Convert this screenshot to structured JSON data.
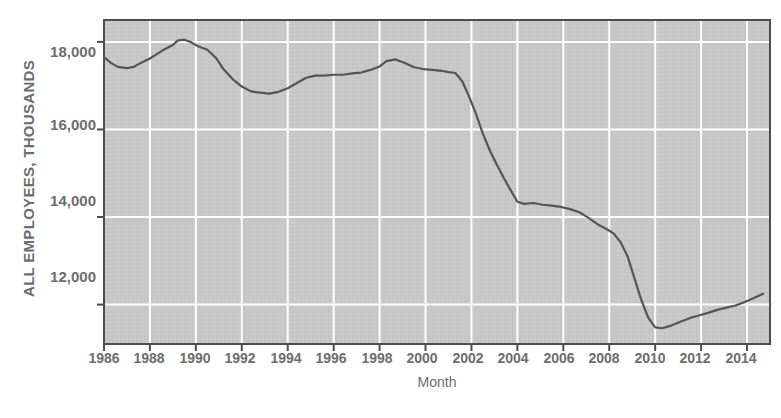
{
  "chart_data": {
    "type": "line",
    "title": "",
    "xlabel": "Month",
    "ylabel": "ALL EMPLOYEES, THOUSANDS",
    "xlim": [
      1986,
      2015
    ],
    "ylim": [
      11100,
      18500
    ],
    "grid": true,
    "legend": "none",
    "line_color": "#555555",
    "plot_background": "#c6c6c6",
    "gridline_color": "#ffffff",
    "axis_color": "#4d4d4d",
    "y_ticks": [
      12000,
      14000,
      16000,
      18000
    ],
    "y_tick_labels": [
      "12,000",
      "14,000",
      "16,000",
      "18,000"
    ],
    "x_ticks": [
      1986,
      1988,
      1990,
      1992,
      1994,
      1996,
      1998,
      2000,
      2002,
      2004,
      2006,
      2008,
      2010,
      2012,
      2014
    ],
    "x_tick_labels": [
      "1986",
      "1988",
      "1990",
      "1992",
      "1994",
      "1996",
      "1998",
      "2000",
      "2002",
      "2004",
      "2006",
      "2008",
      "2010",
      "2012",
      "2014"
    ],
    "series": [
      {
        "name": "All employees, manufacturing",
        "x": [
          1986.0,
          1986.3,
          1986.6,
          1987.0,
          1987.3,
          1987.6,
          1988.0,
          1988.3,
          1988.6,
          1989.0,
          1989.2,
          1989.5,
          1989.8,
          1990.1,
          1990.5,
          1990.9,
          1991.2,
          1991.6,
          1992.0,
          1992.4,
          1992.8,
          1993.2,
          1993.6,
          1994.0,
          1994.4,
          1994.8,
          1995.2,
          1995.6,
          1996.0,
          1996.4,
          1996.8,
          1997.2,
          1997.6,
          1998.0,
          1998.3,
          1998.7,
          1999.1,
          1999.5,
          1999.9,
          2000.3,
          2000.7,
          2001.0,
          2001.3,
          2001.6,
          2001.9,
          2002.2,
          2002.5,
          2002.8,
          2003.1,
          2003.4,
          2003.7,
          2004.0,
          2004.3,
          2004.7,
          2005.1,
          2005.5,
          2005.9,
          2006.3,
          2006.7,
          2007.1,
          2007.5,
          2007.9,
          2008.2,
          2008.5,
          2008.8,
          2009.1,
          2009.4,
          2009.7,
          2010.0,
          2010.3,
          2010.7,
          2011.1,
          2011.5,
          2011.9,
          2012.3,
          2012.7,
          2013.1,
          2013.5,
          2013.9,
          2014.3,
          2014.7
        ],
        "y": [
          17650,
          17520,
          17430,
          17400,
          17430,
          17520,
          17620,
          17720,
          17820,
          17930,
          18030,
          18050,
          17990,
          17900,
          17820,
          17620,
          17380,
          17150,
          16980,
          16870,
          16840,
          16820,
          16860,
          16940,
          17060,
          17180,
          17230,
          17230,
          17250,
          17250,
          17280,
          17300,
          17360,
          17440,
          17560,
          17600,
          17520,
          17420,
          17380,
          17360,
          17340,
          17310,
          17290,
          17100,
          16750,
          16350,
          15900,
          15520,
          15200,
          14900,
          14620,
          14350,
          14300,
          14320,
          14280,
          14260,
          14230,
          14180,
          14110,
          13980,
          13830,
          13720,
          13620,
          13420,
          13100,
          12600,
          12100,
          11700,
          11480,
          11460,
          11520,
          11610,
          11690,
          11750,
          11810,
          11880,
          11930,
          11980,
          12060,
          12150,
          12250
        ]
      }
    ]
  },
  "plot_geometry": {
    "left": 104,
    "top": 20,
    "right": 770,
    "bottom": 344
  }
}
